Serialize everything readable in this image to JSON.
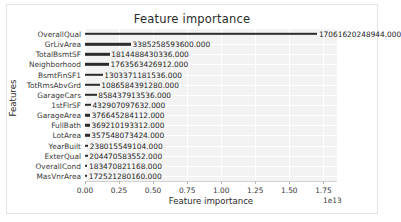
{
  "chart_data": {
    "type": "bar",
    "orientation": "horizontal",
    "title": "Feature importance",
    "xlabel": "Feature importance",
    "ylabel": "Features",
    "grid": true,
    "legend": null,
    "xlim": [
      0,
      18500000000000.0
    ],
    "x_offset_text": "1e13",
    "xticks": [
      0,
      2500000000000,
      5000000000000,
      7500000000000,
      10000000000000,
      12500000000000,
      15000000000000,
      17500000000000
    ],
    "xticklabels": [
      "0.00",
      "0.25",
      "0.50",
      "0.75",
      "1.00",
      "1.25",
      "1.50",
      "1.75"
    ],
    "categories": [
      "OverallQual",
      "GrLivArea",
      "TotalBsmtSF",
      "Neighborhood",
      "BsmtFinSF1",
      "TotRmsAbvGrd",
      "GarageCars",
      "1stFlrSF",
      "GarageArea",
      "FullBath",
      "LotArea",
      "YearBuilt",
      "ExterQual",
      "OverallCond",
      "MasVnrArea"
    ],
    "values": [
      17061620248944.0,
      3385258593600.0,
      1814488430336.0,
      1763563426912.0,
      1303371181536.0,
      1086584391280.0,
      858437913536.0,
      432907097632.0,
      376645284112.0,
      369210193312.0,
      357548073424.0,
      238015549104.0,
      204470583552.0,
      183470821168.0,
      172521280160.0
    ],
    "value_labels": [
      "17061620248944.000",
      "3385258593600.000",
      "1814488430336.000",
      "1763563426912.000",
      "1303371181536.000",
      "1086584391280.000",
      "858437913536.000",
      "432907097632.000",
      "376645284112.000",
      "369210193312.000",
      "357548073424.000",
      "238015549104.000",
      "204470583552.000",
      "183470821168.000",
      "172521280160.000"
    ],
    "colors": {
      "bar": "#2c2c2c",
      "plot_background": "#f3f3f3",
      "figure_background": "#ffffff",
      "grid": "#ffffff",
      "text": "#3a3a3a"
    }
  }
}
